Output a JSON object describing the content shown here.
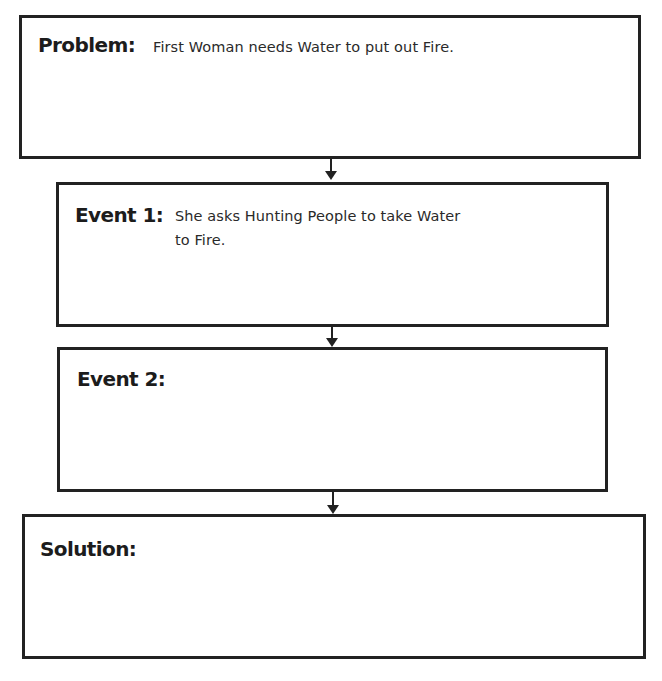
{
  "organizer": {
    "type": "story-sequence-flowchart",
    "boxes": [
      {
        "label": "Problem:",
        "answer_lines": [
          "First Woman needs Water to put out Fire."
        ]
      },
      {
        "label": "Event 1:",
        "answer_lines": [
          "She asks Hunting People to take Water",
          "to Fire."
        ]
      },
      {
        "label": "Event 2:",
        "answer_lines": []
      },
      {
        "label": "Solution:",
        "answer_lines": []
      }
    ],
    "connectors": [
      {
        "from": "Problem",
        "to": "Event 1",
        "icon": "arrow-down-icon"
      },
      {
        "from": "Event 1",
        "to": "Event 2",
        "icon": "arrow-down-icon"
      },
      {
        "from": "Event 2",
        "to": "Solution",
        "icon": "arrow-down-icon"
      }
    ],
    "colors": {
      "border": "#222222",
      "label_text": "#1c1c1c",
      "answer_text": "#2a2a2a",
      "background": "#ffffff"
    }
  }
}
